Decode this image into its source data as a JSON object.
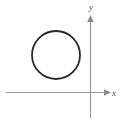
{
  "figure": {
    "background_color": "#ffffff",
    "width": 130,
    "height": 122
  },
  "axes": {
    "x_axis": {
      "label": "x",
      "color": "#9a9a9a",
      "start_x": 6,
      "end_x": 110,
      "y": 92,
      "arrow": "right-arrowhead"
    },
    "y_axis": {
      "label": "y",
      "color": "#9a9a9a",
      "x": 90,
      "start_y": 118,
      "end_y": 16,
      "arrow": "up-arrowhead"
    },
    "origin": {
      "x": 90,
      "y": 92
    }
  },
  "shapes": [
    {
      "name": "circle",
      "type": "circle",
      "center_x": 56,
      "center_y": 55,
      "radius": 24,
      "stroke_color": "#2b2b2b",
      "stroke_width": 1.8,
      "fill": "none",
      "quadrant": "second"
    }
  ],
  "chart_data": {
    "type": "scatter",
    "title": "",
    "xlabel": "x",
    "ylabel": "y",
    "grid": false,
    "legend": null,
    "annotations": [
      {
        "shape": "circle",
        "center": [
          -34,
          37
        ],
        "radius": 24,
        "description": "Circle lying entirely above the x-axis and to the left of the y-axis (second quadrant)"
      }
    ]
  }
}
